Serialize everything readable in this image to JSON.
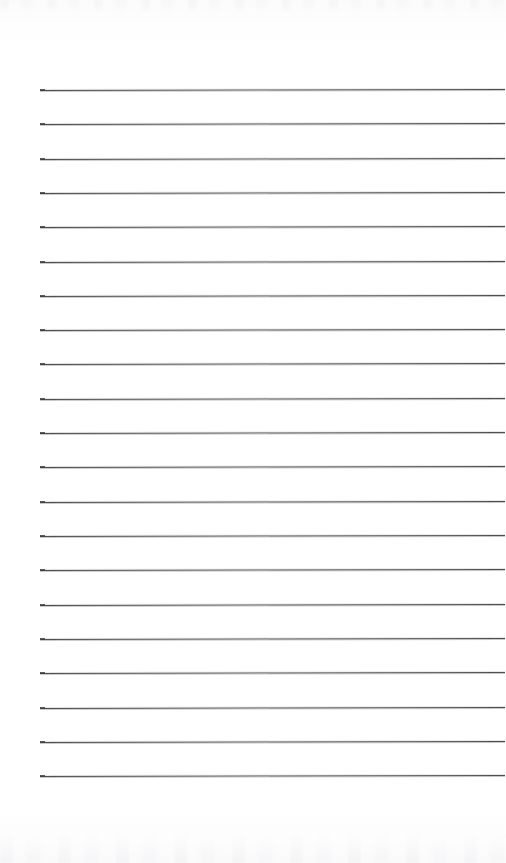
{
  "document": {
    "kind": "scanned-lined-notepad-page",
    "title": "Blank ruled notepad page",
    "page_width": 506,
    "page_height": 863,
    "background_color": "#ffffff",
    "paper_tone": "#fdfdfe",
    "text_content": "",
    "handwriting_present": "no",
    "printed_text_present": "no"
  },
  "ruling": {
    "line_color": "#4f4f52",
    "line_halo_color": "#a8a8b0",
    "line_thickness_px": 1,
    "line_count": 21,
    "left_margin_x": 40,
    "right_end_x": 505,
    "first_line_y": 90,
    "last_line_y": 776,
    "line_spacing_px": 34.3,
    "skew_px_across_width": -1,
    "line_y_positions": [
      90,
      124,
      159,
      193,
      227,
      262,
      296,
      330,
      364,
      399,
      433,
      467,
      502,
      536,
      570,
      605,
      639,
      673,
      708,
      742,
      776
    ]
  },
  "scan_artifacts": {
    "top_noise_band_height": 14,
    "bottom_noise_band_height": 34,
    "noise_color": "#8c8c96",
    "description": "faint gray scanner speckle along top and bottom edges"
  },
  "margins": {
    "top_blank_height": 90,
    "bottom_blank_height": 87,
    "left_blank_width": 40,
    "right_blank_width": 1
  }
}
